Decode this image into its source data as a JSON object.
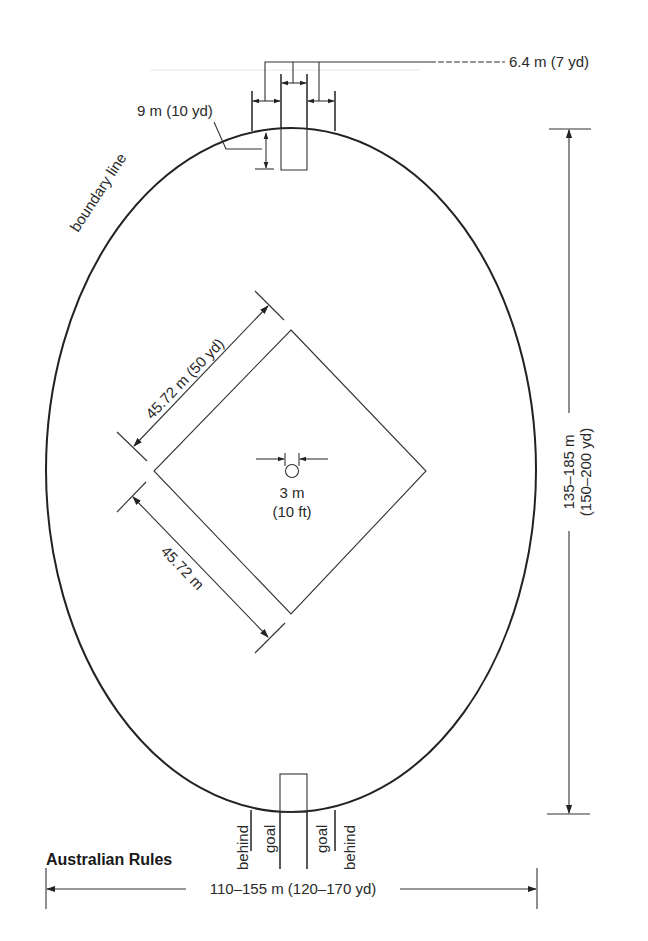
{
  "figure": {
    "title": "Australian Rules",
    "colors": {
      "line": "#222222",
      "text": "#2a2a2a",
      "background": "#ffffff"
    }
  },
  "labels": {
    "goal_width": "6.4 m (7 yd)",
    "behind_line": "9 m (10 yd)",
    "boundary_line": "boundary line",
    "square_side_full": "45.72 m (50 yd)",
    "square_side_short": "45.72 m",
    "centre_circle_metric": "3 m",
    "centre_circle_imperial": "(10 ft)",
    "length_metric": "135–185 m",
    "length_imperial": "(150–200 yd)",
    "width": "110–155 m (120–170 yd)",
    "posts": [
      "behind",
      "goal",
      "goal",
      "behind"
    ]
  },
  "dimensions": {
    "goal_post_spacing": {
      "metric": "6.4 m",
      "imperial": "7 yd"
    },
    "goal_square_depth": {
      "metric": "9 m",
      "imperial": "10 yd"
    },
    "centre_square_side": {
      "metric": "45.72 m",
      "imperial": "50 yd"
    },
    "centre_circle_diameter": {
      "metric": "3 m",
      "imperial": "10 ft"
    },
    "field_length": {
      "metric": "135–185 m",
      "imperial": "150–200 yd"
    },
    "field_width": {
      "metric": "110–155 m",
      "imperial": "120–170 yd"
    }
  }
}
